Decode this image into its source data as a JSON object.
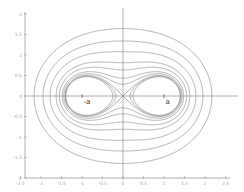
{
  "chart_data": {
    "type": "line",
    "title": "",
    "xlabel": "",
    "ylabel": "",
    "xlim": [
      -2.5,
      2.5
    ],
    "ylim": [
      -2,
      2
    ],
    "grid": false,
    "x_ticks": [
      "-2.5",
      "-2",
      "-1.5",
      "-1",
      "-0.5",
      "0",
      "0.5",
      "1",
      "1.5",
      "2",
      "2.5"
    ],
    "y_ticks": [
      "2",
      "1.5",
      "1",
      "0.5",
      "0",
      "-0.5",
      "-1",
      "-1.5",
      "-2"
    ],
    "focus_a": 1,
    "series": [
      {
        "name": "b=1.925",
        "b": 1.925
      },
      {
        "name": "b=1.674",
        "b": 1.674
      },
      {
        "name": "b=1.472",
        "b": 1.472
      },
      {
        "name": "b=1.288",
        "b": 1.288
      },
      {
        "name": "b=1.185",
        "b": 1.185
      },
      {
        "name": "b=1.09",
        "b": 1.09
      },
      {
        "name": "b=1.04",
        "b": 1.04
      },
      {
        "name": "b=1.0 (lemniscate)",
        "b": 1.0
      },
      {
        "name": "b=0.985",
        "b": 0.985
      },
      {
        "name": "b=0.97",
        "b": 0.97
      }
    ],
    "annotations": [
      {
        "label": "-a",
        "x": -1,
        "y": 0
      },
      {
        "label": "a",
        "x": 1,
        "y": 0
      }
    ]
  }
}
